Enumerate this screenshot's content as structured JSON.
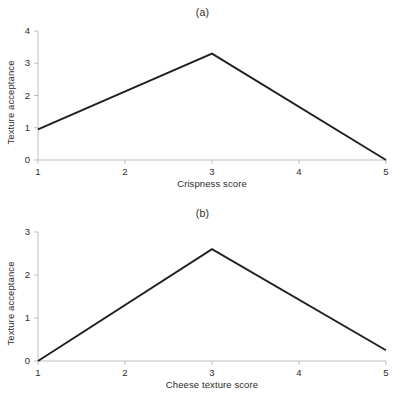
{
  "figure": {
    "background_color": "#ffffff",
    "line_color": "#231f20",
    "axis_color": "#bfbfbf",
    "text_color": "#2b2b2b"
  },
  "chart_data": [
    {
      "type": "line",
      "title": "(a)",
      "xlabel": "Crispness score",
      "ylabel": "Texture acceptance",
      "x": [
        1,
        3,
        5
      ],
      "values": [
        0.95,
        3.3,
        0.0
      ],
      "series": [
        {
          "name": "Texture acceptance vs crispness",
          "values": [
            0.95,
            3.3,
            0.0
          ]
        }
      ],
      "xticks": [
        1,
        2,
        3,
        4,
        5
      ],
      "xtick_labels": [
        "1",
        "2",
        "3",
        "4",
        "5"
      ],
      "yticks": [
        0,
        1,
        2,
        3,
        4
      ],
      "ytick_labels": [
        "0",
        "1",
        "2",
        "3",
        "4"
      ],
      "xlim": [
        1,
        5
      ],
      "ylim": [
        0,
        4
      ],
      "grid": false,
      "legend": false
    },
    {
      "type": "line",
      "title": "(b)",
      "xlabel": "Cheese texture score",
      "ylabel": "Texture acceptance",
      "x": [
        1,
        3,
        5
      ],
      "values": [
        0.0,
        2.6,
        0.25
      ],
      "series": [
        {
          "name": "Texture acceptance vs cheese texture",
          "values": [
            0.0,
            2.6,
            0.25
          ]
        }
      ],
      "xticks": [
        1,
        2,
        3,
        4,
        5
      ],
      "xtick_labels": [
        "1",
        "2",
        "3",
        "4",
        "5"
      ],
      "yticks": [
        0,
        1,
        2,
        3
      ],
      "ytick_labels": [
        "0",
        "1",
        "2",
        "3"
      ],
      "xlim": [
        1,
        5
      ],
      "ylim": [
        0,
        3
      ],
      "grid": false,
      "legend": false
    }
  ]
}
